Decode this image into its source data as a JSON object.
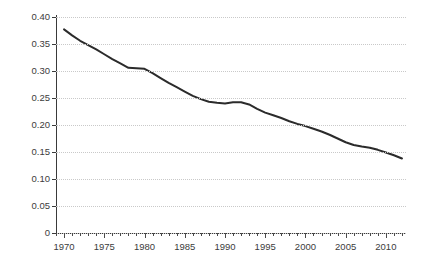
{
  "chart_data": {
    "type": "line",
    "title": "",
    "subtitle": "",
    "xlabel": "",
    "ylabel": "",
    "xlim": [
      1969,
      2012.5
    ],
    "ylim": [
      0,
      0.4
    ],
    "grid": true,
    "legend": false,
    "y_ticks": [
      "0",
      "0.05",
      "0.10",
      "0.15",
      "0.20",
      "0.25",
      "0.30",
      "0.35",
      "0.40"
    ],
    "y_tick_values": [
      0,
      0.05,
      0.1,
      0.15,
      0.2,
      0.25,
      0.3,
      0.35,
      0.4
    ],
    "x_ticks": [
      "1970",
      "1975",
      "1980",
      "1985",
      "1990",
      "1995",
      "2000",
      "2005",
      "2010"
    ],
    "x_tick_values": [
      1970,
      1975,
      1980,
      1985,
      1990,
      1995,
      2000,
      2005,
      2010
    ],
    "x_minor_step": 1,
    "line_color": "#2b2b2b",
    "grid_color": "#c9c9c9",
    "axis_color": "#3a3a3a",
    "series": [
      {
        "name": "series-1",
        "x": [
          1970,
          1971,
          1972,
          1973,
          1974,
          1975,
          1976,
          1977,
          1978,
          1979,
          1980,
          1981,
          1982,
          1983,
          1984,
          1985,
          1986,
          1987,
          1988,
          1989,
          1990,
          1991,
          1992,
          1993,
          1994,
          1995,
          1996,
          1997,
          1998,
          1999,
          2000,
          2001,
          2002,
          2003,
          2004,
          2005,
          2006,
          2007,
          2008,
          2009,
          2010,
          2011,
          2012
        ],
        "values": [
          0.377,
          0.366,
          0.356,
          0.348,
          0.34,
          0.331,
          0.322,
          0.314,
          0.306,
          0.305,
          0.304,
          0.296,
          0.287,
          0.278,
          0.27,
          0.262,
          0.254,
          0.248,
          0.243,
          0.241,
          0.24,
          0.242,
          0.242,
          0.238,
          0.23,
          0.223,
          0.218,
          0.213,
          0.207,
          0.202,
          0.198,
          0.193,
          0.188,
          0.182,
          0.175,
          0.168,
          0.163,
          0.16,
          0.158,
          0.154,
          0.149,
          0.144,
          0.138
        ]
      }
    ]
  }
}
